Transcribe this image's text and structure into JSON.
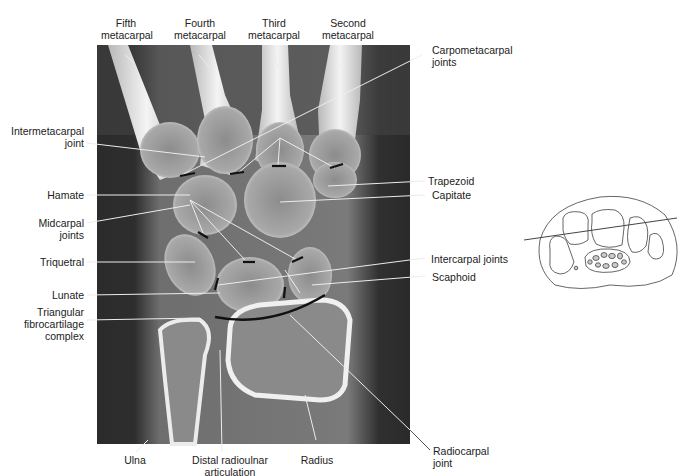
{
  "figure": {
    "colors": {
      "background": "#ffffff",
      "ct_background": "#3a3a3a",
      "ct_soft_tissue": "#7a7a7a",
      "bone": "#d8d8d8",
      "bone_cortex": "#f2f2f2",
      "leader_line": "#e8e8e8",
      "joint_marker": "#111111",
      "label_text": "#222222",
      "inset_stroke": "#555555",
      "inset_fill": "#cccccc"
    }
  },
  "labels": {
    "top": [
      {
        "id": "fifth-metacarpal",
        "line1": "Fifth",
        "line2": "metacarpal"
      },
      {
        "id": "fourth-metacarpal",
        "line1": "Fourth",
        "line2": "metacarpal"
      },
      {
        "id": "third-metacarpal",
        "line1": "Third",
        "line2": "metacarpal"
      },
      {
        "id": "second-metacarpal",
        "line1": "Second",
        "line2": "metacarpal"
      }
    ],
    "left": [
      {
        "id": "intermetacarpal-joint",
        "line1": "Intermetacarpal",
        "line2": "joint"
      },
      {
        "id": "hamate",
        "line1": "Hamate"
      },
      {
        "id": "midcarpal-joints",
        "line1": "Midcarpal",
        "line2": "joints"
      },
      {
        "id": "triquetral",
        "line1": "Triquetral"
      },
      {
        "id": "lunate",
        "line1": "Lunate"
      },
      {
        "id": "tfcc",
        "line1": "Triangular",
        "line2": "fibrocartilage",
        "line3": "complex"
      }
    ],
    "right": [
      {
        "id": "carpometacarpal-joints",
        "line1": "Carpometacarpal",
        "line2": "joints"
      },
      {
        "id": "trapezoid",
        "line1": "Trapezoid"
      },
      {
        "id": "capitate",
        "line1": "Capitate"
      },
      {
        "id": "intercarpal-joints",
        "line1": "Intercarpal joints"
      },
      {
        "id": "scaphoid",
        "line1": "Scaphoid"
      },
      {
        "id": "radiocarpal-joint",
        "line1": "Radiocarpal",
        "line2": "joint"
      }
    ],
    "bottom": [
      {
        "id": "ulna",
        "line1": "Ulna"
      },
      {
        "id": "distal-radioulnar-articulation",
        "line1": "Distal radioulnar",
        "line2": "articulation"
      },
      {
        "id": "radius",
        "line1": "Radius"
      }
    ]
  },
  "inset": {
    "description": "Axial wrist cross-section outline with oblique plane line indicating the coronal CT slice"
  }
}
